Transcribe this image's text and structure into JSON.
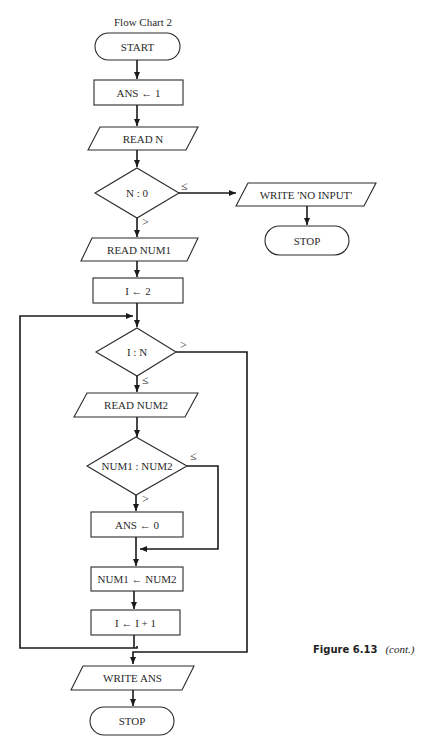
{
  "diagram": {
    "title": "Flow Chart 2",
    "nodes": {
      "start": "START",
      "ans_init": "ANS ← 1",
      "read_n": "READ N",
      "check_n": "N : 0",
      "write_no_input": "WRITE 'NO INPUT'",
      "stop_early": "STOP",
      "read_num1": "READ NUM1",
      "i_init": "I ← 2",
      "check_i": "I : N",
      "read_num2": "READ NUM2",
      "compare": "NUM1 : NUM2",
      "ans_zero": "ANS ← 0",
      "assign_num1": "NUM1 ← NUM2",
      "increment_i": "I ← I + 1",
      "write_ans": "WRITE ANS",
      "stop_end": "STOP"
    },
    "conditions": {
      "n_le": "≤",
      "n_gt": ">",
      "i_gt": ">",
      "i_le": "≤",
      "cmp_le": "≤",
      "cmp_gt": ">"
    }
  },
  "caption": {
    "figure": "Figure 6.13",
    "note": "(cont.)"
  }
}
